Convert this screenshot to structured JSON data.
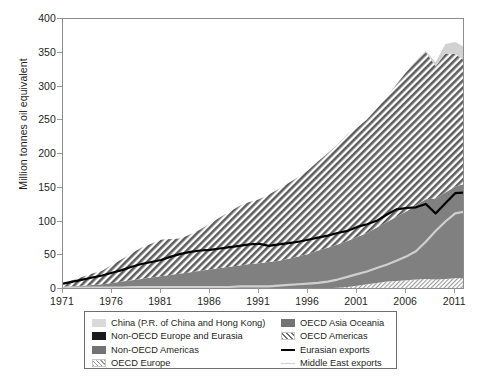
{
  "chart_data": {
    "type": "area",
    "title": "",
    "xlabel": "",
    "ylabel": "Million tonnes oil equivalent",
    "xlim": [
      1971,
      2012
    ],
    "ylim": [
      0,
      400
    ],
    "grid": false,
    "stacked": true,
    "legend_position": "bottom",
    "x": [
      1971,
      1972,
      1973,
      1974,
      1975,
      1976,
      1977,
      1978,
      1979,
      1980,
      1981,
      1982,
      1983,
      1984,
      1985,
      1986,
      1987,
      1988,
      1989,
      1990,
      1991,
      1992,
      1993,
      1994,
      1995,
      1996,
      1997,
      1998,
      1999,
      2000,
      2001,
      2002,
      2003,
      2004,
      2005,
      2006,
      2007,
      2008,
      2009,
      2010,
      2011,
      2012
    ],
    "xticks": [
      1971,
      1976,
      1981,
      1986,
      1991,
      1996,
      2001,
      2006,
      2011
    ],
    "yticks": [
      0,
      50,
      100,
      150,
      200,
      250,
      300,
      350,
      400
    ],
    "series": [
      {
        "name": "OECD Europe",
        "fill": "fine-hatch-light",
        "color": "#d9d9d9",
        "values": [
          0,
          0,
          0,
          0,
          0,
          0,
          0,
          0,
          0,
          0,
          0,
          0,
          0,
          0,
          0,
          0,
          0,
          0,
          0,
          0,
          0,
          0,
          0,
          0,
          0,
          0,
          1,
          1,
          2,
          3,
          5,
          7,
          9,
          11,
          12,
          13,
          14,
          15,
          14,
          15,
          16,
          16
        ]
      },
      {
        "name": "Non-OECD Americas",
        "fill": "solid-dark-gray",
        "color": "#808080",
        "values": [
          3,
          4,
          5,
          6,
          7,
          9,
          11,
          13,
          15,
          17,
          19,
          21,
          23,
          25,
          27,
          29,
          31,
          33,
          35,
          37,
          38,
          40,
          42,
          45,
          48,
          52,
          56,
          60,
          64,
          68,
          72,
          76,
          82,
          88,
          95,
          102,
          110,
          118,
          120,
          128,
          136,
          140
        ]
      },
      {
        "name": "OECD Americas",
        "fill": "coarse-hatch",
        "color": "#9e9e9e",
        "values": [
          6,
          9,
          13,
          17,
          20,
          27,
          33,
          40,
          46,
          50,
          54,
          53,
          52,
          56,
          61,
          68,
          75,
          82,
          88,
          92,
          95,
          100,
          106,
          112,
          118,
          124,
          132,
          140,
          148,
          158,
          162,
          168,
          176,
          186,
          196,
          206,
          214,
          218,
          196,
          206,
          196,
          182
        ]
      },
      {
        "name": "China (P.R. of China and Hong Kong)",
        "fill": "solid-light-gray",
        "color": "#d2d2d2",
        "values": [
          0,
          0,
          0,
          0,
          0,
          0,
          0,
          0,
          0,
          0,
          0,
          0,
          0,
          0,
          0,
          0,
          0,
          0,
          0,
          0,
          0,
          0,
          0,
          0,
          0,
          0,
          0,
          0,
          0,
          0,
          0,
          0,
          0,
          0,
          0,
          0,
          1,
          2,
          6,
          14,
          18,
          20
        ]
      },
      {
        "name": "OECD Asia Oceania",
        "fill": "solid-dark-gray",
        "color": "#6f6f6f",
        "values": [
          0,
          0,
          0,
          0,
          0,
          0,
          0,
          0,
          0,
          0,
          0,
          0,
          0,
          0,
          0,
          0,
          0,
          0,
          0,
          0,
          0,
          0,
          0,
          0,
          0,
          0,
          0,
          0,
          0,
          0,
          0,
          0,
          0,
          0,
          0,
          0,
          0,
          0,
          0,
          0,
          0,
          0
        ]
      },
      {
        "name": "Non-OECD Europe and Eurasia",
        "fill": "solid-black",
        "color": "#1a1a1a",
        "values": [
          0,
          0,
          0,
          0,
          0,
          0,
          0,
          0,
          0,
          0,
          0,
          0,
          0,
          0,
          0,
          0,
          0,
          0,
          0,
          0,
          0,
          0,
          0,
          0,
          0,
          0,
          0,
          0,
          0,
          0,
          0,
          0,
          0,
          0,
          0,
          0,
          0,
          0,
          0,
          0,
          0,
          0
        ]
      }
    ],
    "lines": [
      {
        "name": "Eurasian exports",
        "color": "#000000",
        "width": 2.2,
        "values": [
          8,
          11,
          14,
          17,
          20,
          24,
          28,
          33,
          37,
          40,
          43,
          48,
          52,
          55,
          57,
          58,
          60,
          62,
          64,
          66,
          67,
          64,
          66,
          68,
          70,
          73,
          76,
          79,
          83,
          86,
          92,
          96,
          101,
          110,
          118,
          120,
          121,
          126,
          112,
          127,
          142,
          143
        ]
      },
      {
        "name": "Middle East exports",
        "color": "#cfcfcf",
        "width": 2.2,
        "values": [
          2,
          2,
          2,
          2,
          2,
          2,
          2,
          3,
          3,
          3,
          3,
          3,
          3,
          3,
          3,
          3,
          3,
          3,
          4,
          4,
          4,
          4,
          5,
          6,
          7,
          8,
          9,
          11,
          14,
          18,
          22,
          26,
          31,
          36,
          42,
          48,
          56,
          70,
          86,
          100,
          112,
          115
        ]
      }
    ]
  },
  "legend": {
    "items": [
      {
        "label": "China (P.R. of China and Hong Kong)",
        "swatch": "light-gray-fill"
      },
      {
        "label": "Non-OECD Europe and Eurasia",
        "swatch": "black-fill"
      },
      {
        "label": "Non-OECD Americas",
        "swatch": "dark-gray-fill"
      },
      {
        "label": "OECD Europe",
        "swatch": "fine-hatch-fill"
      },
      {
        "label": "OECD Asia Oceania",
        "swatch": "dark-gray-fill"
      },
      {
        "label": "OECD Americas",
        "swatch": "coarse-hatch-fill"
      },
      {
        "label": "Eurasian exports",
        "swatch": "black-line"
      },
      {
        "label": "Middle East exports",
        "swatch": "light-gray-line"
      }
    ]
  }
}
